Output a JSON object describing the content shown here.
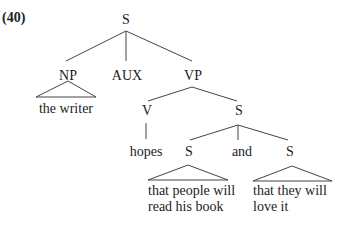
{
  "example_number": "(40)",
  "tree": {
    "root": "S",
    "np": {
      "label": "NP",
      "leaf": "the writer"
    },
    "aux": {
      "label": "AUX"
    },
    "vp": {
      "label": "VP",
      "v": {
        "label": "V",
        "leaf": "hopes"
      },
      "s": {
        "label": "S",
        "left": {
          "label": "S",
          "leaf_line1": "that people will",
          "leaf_line2": "read his book"
        },
        "conj": "and",
        "right": {
          "label": "S",
          "leaf_line1": "that they will",
          "leaf_line2": "love it"
        }
      }
    }
  }
}
